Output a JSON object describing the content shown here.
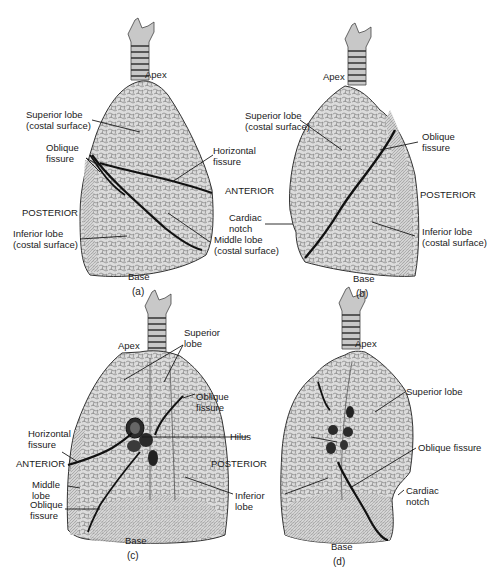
{
  "colors": {
    "lung_fill": "#d9d9d9",
    "trachea_fill": "#c8c8c8",
    "outline": "#333333",
    "fissure": "#111111",
    "leader": "#1a1a1a",
    "hilus_vessel": "#2a2a2a"
  },
  "panels": [
    {
      "id": "a",
      "caption": "(a)",
      "labels": {
        "apex": "Apex",
        "superior_lobe": "Superior lobe\n(costal surface)",
        "oblique_fissure": "Oblique\nfissure",
        "horizontal_fissure": "Horizontal\nfissure",
        "anterior": "ANTERIOR",
        "posterior": "POSTERIOR",
        "inferior_lobe": "Inferior lobe\n(costal surface)",
        "middle_lobe": "Middle lobe\n(costal surface)",
        "base": "Base"
      }
    },
    {
      "id": "b",
      "caption": "(b)",
      "labels": {
        "apex": "Apex",
        "superior_lobe": "Superior lobe\n(costal surface)",
        "oblique_fissure": "Oblique\nfissure",
        "posterior": "POSTERIOR",
        "cardiac_notch": "Cardiac\nnotch",
        "inferior_lobe": "Inferior lobe\n(costal surface)",
        "base": "Base"
      }
    },
    {
      "id": "c",
      "caption": "(c)",
      "labels": {
        "apex": "Apex",
        "superior_lobe": "Superior\nlobe",
        "oblique_fissure_top": "Oblique\nfissure",
        "horizontal_fissure": "Horizontal\nfissure",
        "hilus": "Hilus",
        "anterior": "ANTERIOR",
        "posterior": "POSTERIOR",
        "middle_lobe": "Middle\nlobe",
        "oblique_fissure_bottom": "Oblique\nfissure",
        "inferior_lobe": "Inferior\nlobe",
        "base": "Base"
      }
    },
    {
      "id": "d",
      "caption": "(d)",
      "labels": {
        "apex": "Apex",
        "superior_lobe": "Superior lobe",
        "oblique_fissure": "Oblique fissure",
        "cardiac_notch": "Cardiac\nnotch",
        "base": "Base"
      }
    }
  ]
}
